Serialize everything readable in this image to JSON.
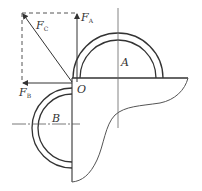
{
  "diagram": {
    "type": "mechanics force diagram",
    "labels": {
      "fa": {
        "main": "F",
        "sub": "A"
      },
      "fb": {
        "main": "F",
        "sub": "B"
      },
      "fc": {
        "main": "F",
        "sub": "C"
      },
      "origin": "O",
      "point_a": "A",
      "point_b": "B"
    },
    "colors": {
      "stroke": "#333333",
      "thin": "#555555",
      "background": "#ffffff"
    }
  }
}
